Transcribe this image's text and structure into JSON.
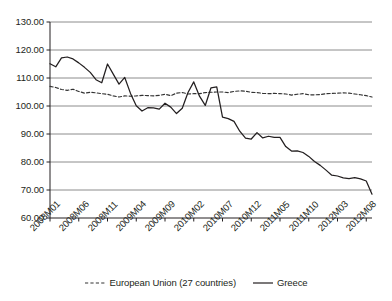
{
  "chart_data": {
    "type": "line",
    "title": "",
    "xlabel": "",
    "ylabel": "",
    "ylim": [
      60,
      130
    ],
    "ytick_values": [
      130,
      120,
      110,
      100,
      90,
      80,
      70,
      60
    ],
    "ytick_labels": [
      "130.00",
      "120.00",
      "110.00",
      "100.00",
      "90.00",
      "80.00",
      "70.00",
      "60.00"
    ],
    "grid": true,
    "legend_position": "bottom",
    "x": [
      "2008M01",
      "2008M02",
      "2008M03",
      "2008M04",
      "2008M05",
      "2008M06",
      "2008M07",
      "2008M08",
      "2008M09",
      "2008M10",
      "2008M11",
      "2008M12",
      "2009M01",
      "2009M02",
      "2009M03",
      "2009M04",
      "2009M05",
      "2009M06",
      "2009M07",
      "2009M08",
      "2009M09",
      "2009M10",
      "2009M11",
      "2009M12",
      "2010M01",
      "2010M02",
      "2010M03",
      "2010M04",
      "2010M05",
      "2010M06",
      "2010M07",
      "2010M08",
      "2010M09",
      "2010M10",
      "2010M11",
      "2010M12",
      "2011M01",
      "2011M02",
      "2011M03",
      "2011M04",
      "2011M05",
      "2011M06",
      "2011M07",
      "2011M08",
      "2011M09",
      "2011M10",
      "2011M11",
      "2011M12",
      "2012M01",
      "2012M02",
      "2012M03",
      "2012M04",
      "2012M05",
      "2012M06",
      "2012M07",
      "2012M08",
      "2012M09"
    ],
    "xtick_labels": [
      "2008M01",
      "2008M06",
      "2008M11",
      "2009M04",
      "2009M09",
      "2010M02",
      "2010M07",
      "2010M12",
      "2011M05",
      "2011M10",
      "2012M03",
      "2012M08"
    ],
    "xtick_indices": [
      0,
      5,
      10,
      15,
      20,
      25,
      30,
      35,
      40,
      45,
      50,
      55
    ],
    "series": [
      {
        "name": "European Union (27 countries)",
        "style": "dashed",
        "color": "#333333",
        "values": [
          107.0,
          106.6,
          105.9,
          105.6,
          106.0,
          105.2,
          104.6,
          104.9,
          104.7,
          104.4,
          104.2,
          103.6,
          103.2,
          103.6,
          103.5,
          103.6,
          103.8,
          103.7,
          103.6,
          103.8,
          104.2,
          103.7,
          104.6,
          104.8,
          104.3,
          104.4,
          104.4,
          104.8,
          104.9,
          105.0,
          105.0,
          104.8,
          105.2,
          105.4,
          105.3,
          104.9,
          104.8,
          104.5,
          104.4,
          104.5,
          104.4,
          104.3,
          103.9,
          104.2,
          104.4,
          104.0,
          104.0,
          104.1,
          104.4,
          104.5,
          104.6,
          104.7,
          104.6,
          104.3,
          104.0,
          103.7,
          103.2
        ]
      },
      {
        "name": "Greece",
        "style": "solid",
        "color": "#231f20",
        "values": [
          115.1,
          114.0,
          117.2,
          117.5,
          116.8,
          115.4,
          113.8,
          112.0,
          109.4,
          108.3,
          115.0,
          111.4,
          107.8,
          110.2,
          104.5,
          100.1,
          98.2,
          99.4,
          99.3,
          98.9,
          101.0,
          99.6,
          97.3,
          99.2,
          104.8,
          108.6,
          103.5,
          100.2,
          106.5,
          106.8,
          96.0,
          95.5,
          94.5,
          91.0,
          88.5,
          88.2,
          90.5,
          88.6,
          89.2,
          88.8,
          88.8,
          85.5,
          83.9,
          84.0,
          83.4,
          82.0,
          80.2,
          78.8,
          77.1,
          75.3,
          75.0,
          74.3,
          74.1,
          74.4,
          74.0,
          73.2,
          68.5
        ]
      }
    ]
  },
  "legend": {
    "items": [
      {
        "label": "European Union (27 countries)",
        "style": "dashed"
      },
      {
        "label": "Greece",
        "style": "solid"
      }
    ]
  }
}
